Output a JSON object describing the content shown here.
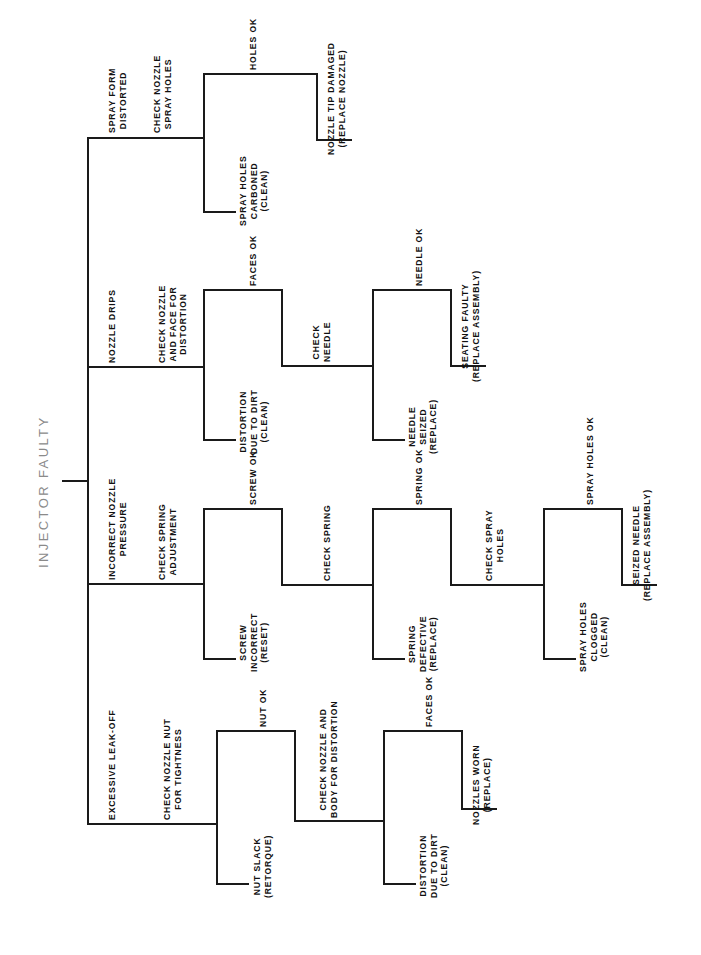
{
  "diagram": {
    "title": "INJECTOR FAULTY",
    "type": "fault-diagnosis-tree",
    "orientation": "rotated-90-ccw",
    "root": "INJECTOR FAULTY",
    "line_color": "#1a1a1a",
    "root_color": "#8a8a8a",
    "labels": {
      "root": "INJECTOR FAULTY",
      "b1_symptom": "SPRAY FORM DISTORTED",
      "b1_check": "CHECK NOZZLE SPRAY HOLES",
      "b1_out_ok": "HOLES OK",
      "b1_out_bad": "SPRAY HOLES CARBONED (CLEAN)",
      "b1_leaf": "NOZZLE TIP DAMAGED (REPLACE NOZZLE)",
      "b2_symptom": "NOZZLE DRIPS",
      "b2_check": "CHECK NOZZLE AND FACE FOR DISTORTION",
      "b2_out_ok": "FACES OK",
      "b2_out_bad": "DISTORTION DUE TO DIRT (CLEAN)",
      "b2_check2": "CHECK NEEDLE",
      "b2_out2_ok": "NEEDLE OK",
      "b2_out2_bad": "NEEDLE SEIZED (REPLACE)",
      "b2_leaf": "SEATING FAULTY (REPLACE ASSEMBLY)",
      "b3_symptom": "INCORRECT NOZZLE PRESSURE",
      "b3_check": "CHECK SPRING ADJUSTMENT",
      "b3_out_ok": "SCREW OK",
      "b3_out_bad": "SCREW INCORRECT (RESET)",
      "b3_check2": "CHECK SPRING",
      "b3_out2_ok": "SPRING OK",
      "b3_out2_bad": "SPRING DEFECTIVE (REPLACE)",
      "b3_check3": "CHECK SPRAY HOLES",
      "b3_out3_ok": "SPRAY HOLES OK",
      "b3_out3_bad": "SPRAY HOLES CLOGGED (CLEAN)",
      "b3_leaf": "SEIZED NEEDLE (REPLACE ASSEMBLY)",
      "b4_symptom": "EXCESSIVE LEAK-OFF",
      "b4_check": "CHECK NOZZLE NUT FOR TIGHTNESS",
      "b4_out_ok": "NUT OK",
      "b4_out_bad": "NUT SLACK (RETORQUE)",
      "b4_check2": "CHECK NOZZLE AND BODY FOR DISTORTION",
      "b4_out2_ok": "FACES OK",
      "b4_out2_bad": "DISTORTION DUE TO DIRT (CLEAN)",
      "b4_leaf": "NOZZLES WORN (REPLACE)"
    },
    "lines": {
      "b1_symptom": [
        "SPRAY FORM",
        "DISTORTED"
      ],
      "b1_check": [
        "CHECK NOZZLE",
        "SPRAY HOLES"
      ],
      "b1_out_ok": [
        "HOLES OK"
      ],
      "b1_out_bad": [
        "SPRAY HOLES",
        "CARBONED",
        "(CLEAN)"
      ],
      "b1_leaf": [
        "NOZZLE TIP DAMAGED",
        "(REPLACE NOZZLE)"
      ],
      "b2_symptom": [
        "NOZZLE DRIPS"
      ],
      "b2_check": [
        "CHECK NOZZLE",
        "AND FACE FOR",
        "DISTORTION"
      ],
      "b2_out_ok": [
        "FACES OK"
      ],
      "b2_out_bad": [
        "DISTORTION",
        "DUE TO DIRT",
        "(CLEAN)"
      ],
      "b2_check2": [
        "CHECK",
        "NEEDLE"
      ],
      "b2_out2_ok": [
        "NEEDLE OK"
      ],
      "b2_out2_bad": [
        "NEEDLE",
        "SEIZED",
        "(REPLACE)"
      ],
      "b2_leaf": [
        "SEATING FAULTY",
        "(REPLACE ASSEMBLY)"
      ],
      "b3_symptom": [
        "INCORRECT NOZZLE",
        "PRESSURE"
      ],
      "b3_check": [
        "CHECK SPRING",
        "ADJUSTMENT"
      ],
      "b3_out_ok": [
        "SCREW OK"
      ],
      "b3_out_bad": [
        "SCREW",
        "INCORRECT",
        "(RESET)"
      ],
      "b3_check2": [
        "CHECK SPRING"
      ],
      "b3_out2_ok": [
        "SPRING OK"
      ],
      "b3_out2_bad": [
        "SPRING",
        "DEFECTIVE",
        "(REPLACE)"
      ],
      "b3_check3": [
        "CHECK SPRAY",
        "HOLES"
      ],
      "b3_out3_ok": [
        "SPRAY HOLES OK"
      ],
      "b3_out3_bad": [
        "SPRAY HOLES",
        "CLOGGED",
        "(CLEAN)"
      ],
      "b3_leaf": [
        "SEIZED NEEDLE",
        "(REPLACE ASSEMBLY)"
      ],
      "b4_symptom": [
        "EXCESSIVE LEAK-OFF"
      ],
      "b4_check": [
        "CHECK NOZZLE NUT",
        "FOR TIGHTNESS"
      ],
      "b4_out_ok": [
        "NUT OK"
      ],
      "b4_out_bad": [
        "NUT SLACK",
        "(RETORQUE)"
      ],
      "b4_check2": [
        "CHECK NOZZLE AND",
        "BODY FOR DISTORTION"
      ],
      "b4_out2_ok": [
        "FACES OK"
      ],
      "b4_out2_bad": [
        "DISTORTION",
        "DUE TO DIRT",
        "(CLEAN)"
      ],
      "b4_leaf": [
        "NOZZLES WORN",
        "(REPLACE)"
      ]
    }
  }
}
